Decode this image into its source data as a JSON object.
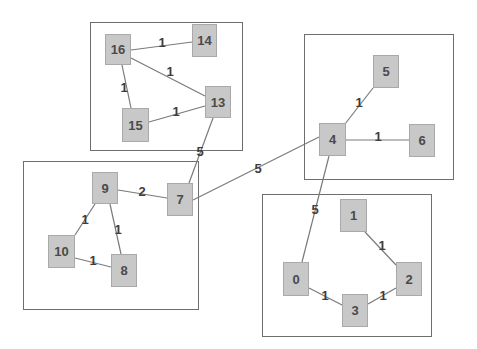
{
  "diagram": {
    "type": "weighted-graph",
    "colors": {
      "node_fill": "#c8c8c8",
      "node_border": "#a9a9a9",
      "node_text": "#4a4a4a",
      "edge": "#7a7a7a",
      "cluster_border": "#6e6e6e",
      "background": "#ffffff"
    },
    "clusters": [
      {
        "id": "cluster-a",
        "nodes": [
          "13",
          "14",
          "15",
          "16"
        ],
        "x": 90,
        "y": 22,
        "w": 153,
        "h": 129
      },
      {
        "id": "cluster-b",
        "nodes": [
          "7",
          "8",
          "9",
          "10"
        ],
        "x": 23,
        "y": 161,
        "w": 176,
        "h": 149
      },
      {
        "id": "cluster-c",
        "nodes": [
          "4",
          "5",
          "6"
        ],
        "x": 304,
        "y": 34,
        "w": 150,
        "h": 146
      },
      {
        "id": "cluster-d",
        "nodes": [
          "0",
          "1",
          "2",
          "3"
        ],
        "x": 262,
        "y": 194,
        "w": 170,
        "h": 143
      }
    ],
    "nodes": [
      {
        "id": "0",
        "label": "0",
        "x": 283,
        "y": 262,
        "w": 26,
        "h": 34
      },
      {
        "id": "1",
        "label": "1",
        "x": 340,
        "y": 199,
        "w": 27,
        "h": 33
      },
      {
        "id": "2",
        "label": "2",
        "x": 396,
        "y": 262,
        "w": 26,
        "h": 34
      },
      {
        "id": "3",
        "label": "3",
        "x": 342,
        "y": 294,
        "w": 26,
        "h": 33
      },
      {
        "id": "4",
        "label": "4",
        "x": 319,
        "y": 123,
        "w": 27,
        "h": 33
      },
      {
        "id": "5",
        "label": "5",
        "x": 373,
        "y": 55,
        "w": 26,
        "h": 33
      },
      {
        "id": "6",
        "label": "6",
        "x": 409,
        "y": 124,
        "w": 26,
        "h": 33
      },
      {
        "id": "7",
        "label": "7",
        "x": 167,
        "y": 183,
        "w": 26,
        "h": 33
      },
      {
        "id": "8",
        "label": "8",
        "x": 111,
        "y": 254,
        "w": 26,
        "h": 33
      },
      {
        "id": "9",
        "label": "9",
        "x": 92,
        "y": 172,
        "w": 26,
        "h": 32
      },
      {
        "id": "10",
        "label": "10",
        "x": 48,
        "y": 235,
        "w": 27,
        "h": 33
      },
      {
        "id": "13",
        "label": "13",
        "x": 205,
        "y": 86,
        "w": 26,
        "h": 32
      },
      {
        "id": "14",
        "label": "14",
        "x": 192,
        "y": 24,
        "w": 25,
        "h": 33
      },
      {
        "id": "15",
        "label": "15",
        "x": 122,
        "y": 108,
        "w": 27,
        "h": 34
      },
      {
        "id": "16",
        "label": "16",
        "x": 105,
        "y": 34,
        "w": 26,
        "h": 31
      }
    ],
    "edges": [
      {
        "from": "16",
        "to": "14",
        "weight": "1",
        "x1": 131,
        "y1": 50,
        "x2": 192,
        "y2": 42,
        "lx": 162,
        "ly": 42
      },
      {
        "from": "16",
        "to": "13",
        "weight": "1",
        "x1": 131,
        "y1": 58,
        "x2": 205,
        "y2": 96,
        "lx": 170,
        "ly": 71
      },
      {
        "from": "16",
        "to": "15",
        "weight": "1",
        "x1": 122,
        "y1": 65,
        "x2": 131,
        "y2": 108,
        "lx": 124,
        "ly": 87
      },
      {
        "from": "15",
        "to": "13",
        "weight": "1",
        "x1": 149,
        "y1": 122,
        "x2": 205,
        "y2": 106,
        "lx": 176,
        "ly": 111
      },
      {
        "from": "13",
        "to": "7",
        "weight": "5",
        "x1": 213,
        "y1": 118,
        "x2": 189,
        "y2": 183,
        "lx": 200,
        "ly": 151
      },
      {
        "from": "9",
        "to": "7",
        "weight": "2",
        "x1": 118,
        "y1": 190,
        "x2": 167,
        "y2": 198,
        "lx": 142,
        "ly": 191
      },
      {
        "from": "9",
        "to": "10",
        "weight": "1",
        "x1": 95,
        "y1": 204,
        "x2": 75,
        "y2": 235,
        "lx": 85,
        "ly": 219
      },
      {
        "from": "9",
        "to": "8",
        "weight": "1",
        "x1": 110,
        "y1": 204,
        "x2": 121,
        "y2": 254,
        "lx": 118,
        "ly": 229
      },
      {
        "from": "10",
        "to": "8",
        "weight": "1",
        "x1": 75,
        "y1": 258,
        "x2": 111,
        "y2": 267,
        "lx": 93,
        "ly": 260
      },
      {
        "from": "7",
        "to": "4",
        "weight": "5",
        "x1": 193,
        "y1": 200,
        "x2": 319,
        "y2": 137,
        "lx": 258,
        "ly": 168
      },
      {
        "from": "4",
        "to": "5",
        "weight": "1",
        "x1": 345,
        "y1": 124,
        "x2": 373,
        "y2": 88,
        "lx": 359,
        "ly": 102
      },
      {
        "from": "4",
        "to": "6",
        "weight": "1",
        "x1": 346,
        "y1": 140,
        "x2": 409,
        "y2": 140,
        "lx": 378,
        "ly": 136
      },
      {
        "from": "4",
        "to": "0",
        "weight": "5",
        "x1": 329,
        "y1": 156,
        "x2": 302,
        "y2": 262,
        "lx": 315,
        "ly": 209
      },
      {
        "from": "1",
        "to": "2",
        "weight": "1",
        "x1": 365,
        "y1": 232,
        "x2": 396,
        "y2": 265,
        "lx": 382,
        "ly": 245
      },
      {
        "from": "0",
        "to": "3",
        "weight": "1",
        "x1": 309,
        "y1": 288,
        "x2": 342,
        "y2": 305,
        "lx": 325,
        "ly": 295
      },
      {
        "from": "3",
        "to": "2",
        "weight": "1",
        "x1": 368,
        "y1": 304,
        "x2": 396,
        "y2": 288,
        "lx": 383,
        "ly": 295
      }
    ]
  }
}
